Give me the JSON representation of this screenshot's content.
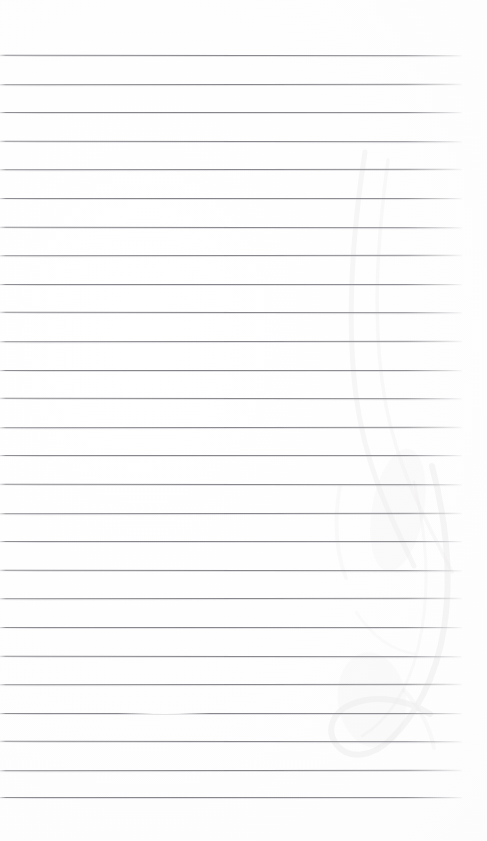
{
  "document": {
    "kind": "scanned-ruled-notebook-page",
    "title": "Blank lined notebook page",
    "page_width": 487,
    "page_height": 841,
    "background_color": "#fefefe",
    "content_text": "",
    "is_blank": true
  },
  "ruling": {
    "line_color": "#84848a",
    "line_secondary_color": "#b0b0b6",
    "line_count": 28,
    "first_line_y": 55,
    "line_spacing": 28.6,
    "line_start_x": 0,
    "line_end_x": 462,
    "top_margin": 55,
    "bottom_margin": 44,
    "right_margin": 25,
    "lines_y": [
      55,
      83.6,
      112.2,
      140.8,
      169.4,
      198,
      226.6,
      255.2,
      283.8,
      312.4,
      341,
      369.6,
      398.2,
      426.8,
      455.4,
      484,
      512.6,
      541.2,
      569.8,
      598.4,
      627,
      655.6,
      684.2,
      712.8,
      741.4,
      770,
      797
    ]
  },
  "artifacts": {
    "bleed_through_color": "#c9c3c6",
    "bleed_through_label": "faint verso pencil show-through",
    "erased_segment": {
      "line_index": 23,
      "x": 118,
      "width": 92,
      "label": "erased line segment"
    },
    "smudges": [
      {
        "x": 352,
        "y": 150,
        "w": 54,
        "h": 190,
        "rot": -12,
        "opacity": 0.12
      },
      {
        "x": 392,
        "y": 440,
        "w": 96,
        "h": 250,
        "rot": 8,
        "opacity": 0.14
      },
      {
        "x": 330,
        "y": 500,
        "w": 70,
        "h": 120,
        "rot": -20,
        "opacity": 0.1
      },
      {
        "x": 408,
        "y": 676,
        "w": 80,
        "h": 150,
        "rot": 14,
        "opacity": 0.12
      }
    ]
  }
}
